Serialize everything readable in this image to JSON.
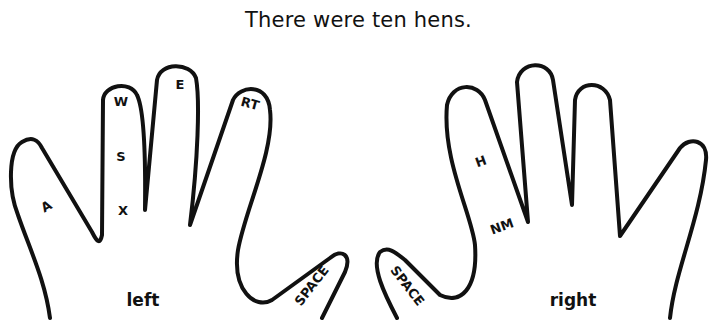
{
  "title": "There were ten hens.",
  "left_hand": {
    "label": "left",
    "keys": {
      "pinky": "A",
      "ring_top": "W",
      "ring_mid": "S",
      "ring_bottom": "X",
      "middle": "E",
      "index": "RT",
      "thumb": "SPACE"
    }
  },
  "right_hand": {
    "label": "right",
    "keys": {
      "index_top": "H",
      "index_bottom": "NM",
      "thumb": "SPACE"
    }
  },
  "colors": {
    "ink": "#111111",
    "background": "#ffffff"
  }
}
